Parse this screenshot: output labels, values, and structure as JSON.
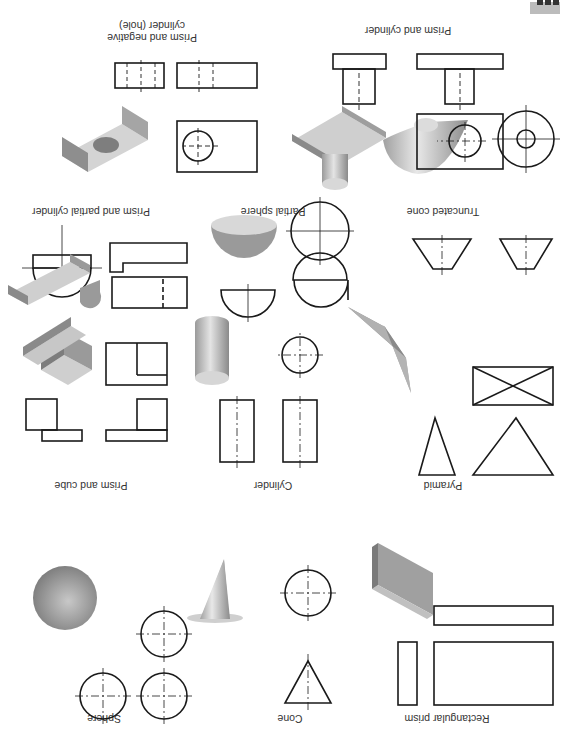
{
  "page": {
    "orientation": "rotated-180",
    "badge": {
      "color": "#bcbcbc",
      "glyph_color": "#333333"
    }
  },
  "panels": [
    {
      "id": "rectangular-prism",
      "label": "Rectangular prism",
      "views": [
        "isometric",
        "front",
        "side",
        "top"
      ]
    },
    {
      "id": "cone",
      "label": "Cone",
      "views": [
        "isometric",
        "front",
        "top"
      ]
    },
    {
      "id": "sphere",
      "label": "Sphere",
      "views": [
        "isometric",
        "front",
        "side",
        "top"
      ]
    },
    {
      "id": "pyramid",
      "label": "Pyramid",
      "views": [
        "isometric",
        "front",
        "side",
        "top"
      ]
    },
    {
      "id": "cylinder",
      "label": "Cylinder",
      "views": [
        "isometric",
        "front",
        "side",
        "top"
      ]
    },
    {
      "id": "prism-and-cube",
      "label": "Prism and cube",
      "views": [
        "isometric",
        "front",
        "side",
        "top"
      ]
    },
    {
      "id": "truncated-cone",
      "label": "Truncated cone",
      "views": [
        "isometric",
        "front",
        "side",
        "top"
      ]
    },
    {
      "id": "partial-sphere",
      "label": "Partial sphere",
      "views": [
        "isometric",
        "front",
        "side",
        "top"
      ]
    },
    {
      "id": "prism-and-partial-cylinder",
      "label": "Prism and partial cylinder",
      "views": [
        "isometric",
        "front",
        "side",
        "top"
      ]
    },
    {
      "id": "prism-and-cylinder",
      "label": "Prism and cylinder",
      "views": [
        "isometric",
        "front",
        "side",
        "top"
      ]
    },
    {
      "id": "prism-and-negative-cylinder",
      "label": "Prism and negative\ncylinder (hole)",
      "views": [
        "isometric",
        "front",
        "side",
        "top"
      ]
    }
  ],
  "colors": {
    "line": "#1a1a1a",
    "shade_dark": "#8a8a8a",
    "shade_mid": "#a9a9a9",
    "shade_light": "#d6d6d6"
  }
}
